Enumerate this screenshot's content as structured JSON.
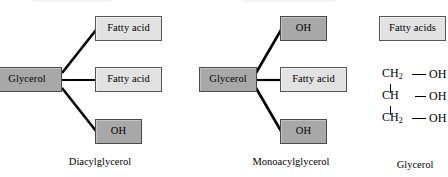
{
  "figure": {
    "panels": [
      {
        "id": "diacylglycerol",
        "caption": "Diacylglycerol",
        "center_label": "Glycerol",
        "branches": [
          {
            "label": "Fatty acid",
            "tone": "light",
            "position": "top"
          },
          {
            "label": "Fatty acid",
            "tone": "light",
            "position": "middle"
          },
          {
            "label": "OH",
            "tone": "dark",
            "position": "bottom"
          }
        ]
      },
      {
        "id": "monoacylglycerol",
        "caption": "Monoacylglycerol",
        "center_label": "Glycerol",
        "branches": [
          {
            "label": "OH",
            "tone": "dark",
            "position": "top"
          },
          {
            "label": "Fatty acid",
            "tone": "light",
            "position": "middle"
          },
          {
            "label": "OH",
            "tone": "dark",
            "position": "bottom"
          }
        ]
      },
      {
        "id": "glycerol",
        "caption": "Glycerol",
        "product_box": {
          "label": "Fatty acids",
          "tone": "light"
        },
        "structure": {
          "type": "skeletal-formula",
          "rows": [
            {
              "atom_main": "CH",
              "atom_sub": "2",
              "bond": "—",
              "group": "OH"
            },
            {
              "atom_main": "CH",
              "atom_sub": "",
              "bond": "—",
              "group": "OH"
            },
            {
              "atom_main": "CH",
              "atom_sub": "2",
              "bond": "—",
              "group": "OH"
            }
          ]
        }
      }
    ]
  },
  "colors": {
    "dark_box_fill": "#a8a8a8",
    "light_box_fill": "#e2e2e2",
    "box_border": "#4a4a4a",
    "connector": "#000000",
    "background": "#ffffff",
    "text": "#000000"
  }
}
